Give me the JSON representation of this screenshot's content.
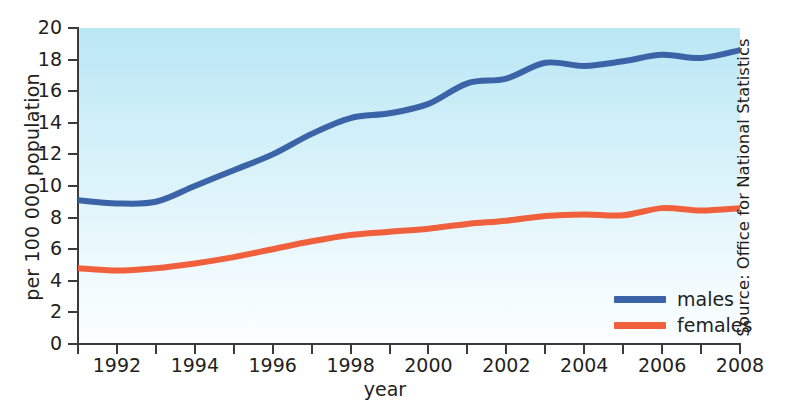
{
  "chart_data": {
    "type": "line",
    "title": "",
    "xlabel": "year",
    "ylabel": "per 100 000 population",
    "xlim": [
      1991,
      2008
    ],
    "ylim": [
      0,
      20
    ],
    "ytick_values": [
      0,
      2,
      4,
      6,
      8,
      10,
      12,
      14,
      16,
      18,
      20
    ],
    "xtick_values": [
      1991,
      1992,
      1993,
      1994,
      1995,
      1996,
      1997,
      1998,
      1999,
      2000,
      2001,
      2002,
      2003,
      2004,
      2005,
      2006,
      2007,
      2008
    ],
    "xtick_labels": [
      "",
      "1992",
      "",
      "1994",
      "",
      "1996",
      "",
      "1998",
      "",
      "2000",
      "",
      "2002",
      "",
      "2004",
      "",
      "2006",
      "",
      "2008"
    ],
    "grid": false,
    "legend_position": "lower-right",
    "x": [
      1991,
      1992,
      1993,
      1994,
      1995,
      1996,
      1997,
      1998,
      1999,
      2000,
      2001,
      2002,
      2003,
      2004,
      2005,
      2006,
      2007,
      2008
    ],
    "series": [
      {
        "name": "males",
        "color": "#3a63a8",
        "values": [
          9.1,
          8.9,
          9.0,
          10.0,
          11.0,
          12.0,
          13.3,
          14.3,
          14.6,
          15.2,
          16.5,
          16.8,
          17.8,
          17.6,
          17.9,
          18.3,
          18.1,
          18.6
        ]
      },
      {
        "name": "females",
        "color": "#f0603c",
        "values": [
          4.8,
          4.65,
          4.8,
          5.1,
          5.5,
          6.0,
          6.5,
          6.9,
          7.1,
          7.3,
          7.6,
          7.8,
          8.1,
          8.2,
          8.15,
          8.6,
          8.45,
          8.6
        ]
      }
    ],
    "source": "Source: Office for National Statistics"
  },
  "legend": {
    "items": [
      {
        "label": "males"
      },
      {
        "label": "females"
      }
    ]
  },
  "colors": {
    "males": "#3a63a8",
    "females": "#f0603c",
    "axis": "#3b3b3b",
    "plot_bg_top": "#b9e7f4",
    "plot_bg_bottom": "#fbfeff"
  }
}
